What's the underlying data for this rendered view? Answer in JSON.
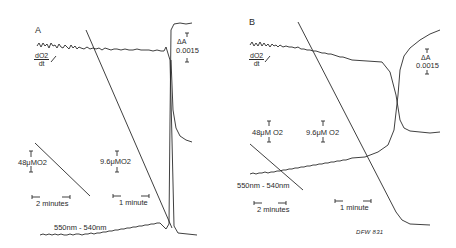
{
  "figure": {
    "panels": [
      {
        "id": "A",
        "letter": "A",
        "rate_label_num": "dO2",
        "rate_label_den": "dt",
        "delta_a_label": "ΔA",
        "delta_a_value": "0.0015",
        "o2_scale_large": "48μMO2",
        "o2_scale_small": "9.6μMO2",
        "time_scale_large": "2 minutes",
        "time_scale_small": "1 minute",
        "wavelength_label": "550nm - 540nm"
      },
      {
        "id": "B",
        "letter": "B",
        "rate_label_num": "dO2",
        "rate_label_den": "dt",
        "delta_a_label": "ΔA",
        "delta_a_value": "0.0015",
        "o2_scale_large": "48μM O2",
        "o2_scale_small": "9.6μM O2",
        "time_scale_large": "2 minutes",
        "time_scale_small": "1 minute",
        "wavelength_label": "550nm - 540nm"
      }
    ],
    "signature": "DFW 831",
    "ink_color": "#2a2a2a",
    "background": "#ffffff"
  }
}
